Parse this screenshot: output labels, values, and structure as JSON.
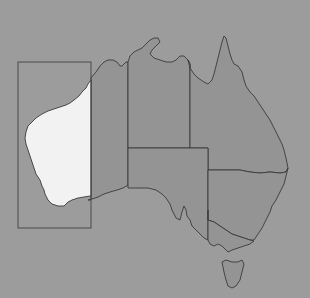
{
  "map": {
    "subject": "Australia",
    "highlighted_region": "Western Australia (south-west portion)",
    "colors": {
      "background": "#9c9c9c",
      "land": "#949494",
      "highlight": "#f2f2f2",
      "borders": "#3a3a3a",
      "inset_box": "#4a4a4a"
    },
    "regions": [
      {
        "id": "western-australia",
        "highlighted": true
      },
      {
        "id": "northern-territory",
        "highlighted": false
      },
      {
        "id": "south-australia",
        "highlighted": false
      },
      {
        "id": "queensland",
        "highlighted": false
      },
      {
        "id": "new-south-wales",
        "highlighted": false
      },
      {
        "id": "victoria",
        "highlighted": false
      },
      {
        "id": "tasmania",
        "highlighted": false
      }
    ],
    "inset_box": {
      "x": 18,
      "y": 62,
      "width": 73,
      "height": 166
    }
  }
}
